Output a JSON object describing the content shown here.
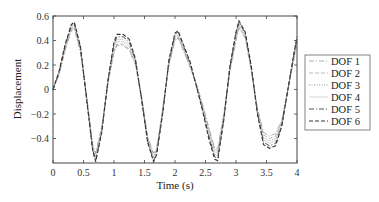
{
  "chart_data": {
    "type": "line",
    "title": "",
    "xlabel": "Time (s)",
    "ylabel": "Displacement",
    "xlim": [
      0,
      4
    ],
    "ylim": [
      -0.6,
      0.6
    ],
    "xticks": [
      0,
      0.5,
      1,
      1.5,
      2,
      2.5,
      3,
      3.5,
      4
    ],
    "xtick_labels": [
      "0",
      "0.5",
      "1",
      "1.5",
      "2",
      "2.5",
      "3",
      "3.5",
      "4"
    ],
    "yticks": [
      -0.4,
      -0.2,
      0,
      0.2,
      0.4,
      0.6
    ],
    "ytick_labels": [
      "−0.4",
      "−0.2",
      "0",
      "0.2",
      "0.4",
      "0.6"
    ],
    "grid": false,
    "legend_position": "right-outside",
    "x": [
      0,
      0.1,
      0.2,
      0.3,
      0.35,
      0.45,
      0.55,
      0.65,
      0.7,
      0.8,
      0.9,
      1.0,
      1.05,
      1.15,
      1.25,
      1.35,
      1.45,
      1.55,
      1.65,
      1.7,
      1.8,
      1.9,
      2.0,
      2.05,
      2.15,
      2.25,
      2.35,
      2.45,
      2.55,
      2.65,
      2.7,
      2.8,
      2.9,
      3.0,
      3.05,
      3.15,
      3.25,
      3.35,
      3.45,
      3.55,
      3.65,
      3.75,
      3.85,
      3.95,
      4.0
    ],
    "series": [
      {
        "name": "DOF 1",
        "style": "dashdot-light",
        "color": "#9a9a9a",
        "values": [
          0.0,
          0.12,
          0.32,
          0.48,
          0.5,
          0.3,
          -0.05,
          -0.45,
          -0.52,
          -0.3,
          0.05,
          0.3,
          0.36,
          0.36,
          0.32,
          0.2,
          -0.05,
          -0.38,
          -0.52,
          -0.48,
          -0.15,
          0.2,
          0.4,
          0.42,
          0.3,
          0.18,
          0.05,
          -0.12,
          -0.3,
          -0.48,
          -0.48,
          -0.2,
          0.15,
          0.4,
          0.5,
          0.42,
          0.15,
          -0.15,
          -0.35,
          -0.38,
          -0.36,
          -0.25,
          0.0,
          0.25,
          0.38
        ]
      },
      {
        "name": "DOF 2",
        "style": "dashed-light",
        "color": "#a8a8a8",
        "values": [
          0.0,
          0.13,
          0.33,
          0.49,
          0.51,
          0.31,
          -0.06,
          -0.46,
          -0.53,
          -0.31,
          0.05,
          0.31,
          0.37,
          0.37,
          0.33,
          0.21,
          -0.05,
          -0.39,
          -0.53,
          -0.49,
          -0.16,
          0.2,
          0.41,
          0.43,
          0.31,
          0.18,
          0.04,
          -0.13,
          -0.31,
          -0.49,
          -0.5,
          -0.21,
          0.15,
          0.41,
          0.51,
          0.43,
          0.16,
          -0.16,
          -0.37,
          -0.4,
          -0.38,
          -0.26,
          0.0,
          0.26,
          0.39
        ]
      },
      {
        "name": "DOF 3",
        "style": "dotted",
        "color": "#8c8c8c",
        "values": [
          0.0,
          0.13,
          0.34,
          0.5,
          0.52,
          0.32,
          -0.06,
          -0.47,
          -0.55,
          -0.32,
          0.06,
          0.33,
          0.39,
          0.39,
          0.35,
          0.22,
          -0.06,
          -0.4,
          -0.55,
          -0.5,
          -0.17,
          0.21,
          0.42,
          0.44,
          0.32,
          0.19,
          0.04,
          -0.14,
          -0.33,
          -0.51,
          -0.52,
          -0.22,
          0.16,
          0.43,
          0.53,
          0.44,
          0.17,
          -0.17,
          -0.39,
          -0.42,
          -0.4,
          -0.27,
          0.0,
          0.27,
          0.4
        ]
      },
      {
        "name": "DOF 4",
        "style": "solid-light",
        "color": "#c4c4c4",
        "values": [
          0.0,
          0.14,
          0.35,
          0.51,
          0.53,
          0.33,
          -0.07,
          -0.48,
          -0.56,
          -0.33,
          0.06,
          0.35,
          0.41,
          0.41,
          0.37,
          0.23,
          -0.06,
          -0.41,
          -0.56,
          -0.51,
          -0.17,
          0.22,
          0.44,
          0.45,
          0.33,
          0.2,
          0.04,
          -0.15,
          -0.35,
          -0.53,
          -0.54,
          -0.23,
          0.17,
          0.44,
          0.54,
          0.45,
          0.17,
          -0.18,
          -0.41,
          -0.44,
          -0.42,
          -0.28,
          0.0,
          0.28,
          0.41
        ]
      },
      {
        "name": "DOF 5",
        "style": "dashdot",
        "color": "#555555",
        "values": [
          0.0,
          0.14,
          0.36,
          0.52,
          0.54,
          0.34,
          -0.07,
          -0.49,
          -0.58,
          -0.34,
          0.07,
          0.37,
          0.43,
          0.43,
          0.39,
          0.24,
          -0.07,
          -0.42,
          -0.58,
          -0.52,
          -0.18,
          0.23,
          0.45,
          0.47,
          0.34,
          0.21,
          0.03,
          -0.16,
          -0.37,
          -0.55,
          -0.56,
          -0.24,
          0.18,
          0.46,
          0.55,
          0.46,
          0.18,
          -0.19,
          -0.43,
          -0.46,
          -0.44,
          -0.29,
          0.0,
          0.29,
          0.42
        ]
      },
      {
        "name": "DOF 6",
        "style": "dashed",
        "color": "#333333",
        "values": [
          0.0,
          0.15,
          0.37,
          0.53,
          0.55,
          0.35,
          -0.08,
          -0.5,
          -0.59,
          -0.35,
          0.07,
          0.39,
          0.45,
          0.45,
          0.41,
          0.25,
          -0.07,
          -0.43,
          -0.59,
          -0.53,
          -0.19,
          0.24,
          0.46,
          0.48,
          0.35,
          0.22,
          0.03,
          -0.17,
          -0.39,
          -0.57,
          -0.58,
          -0.25,
          0.19,
          0.47,
          0.56,
          0.47,
          0.19,
          -0.2,
          -0.45,
          -0.48,
          -0.46,
          -0.3,
          0.0,
          0.3,
          0.43
        ]
      }
    ]
  }
}
